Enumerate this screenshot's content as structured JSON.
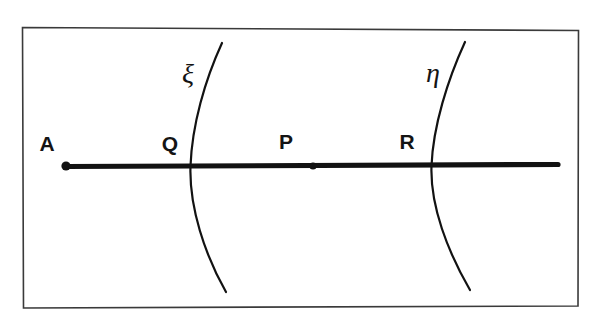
{
  "figure": {
    "title": "",
    "background_color": "#ffffff",
    "ink_color": "#121212",
    "frame": {
      "name": "figure-border",
      "color": "#3a3a3a",
      "x": 22,
      "y": 27,
      "width": 556,
      "height": 280
    },
    "line": {
      "name": "horizontal-axis-line",
      "x_start": 66,
      "x_end": 558,
      "y": 166,
      "thickness": 5,
      "color": "#121212"
    },
    "points": [
      {
        "id": "A",
        "label": "A",
        "label_x": 47,
        "label_y": 151,
        "dot_x": 66,
        "dot_y": 166,
        "has_dot": true,
        "dot_radius": 4.6
      },
      {
        "id": "Q",
        "label": "Q",
        "label_x": 170,
        "label_y": 151,
        "dot_x": 191,
        "dot_y": 166,
        "has_dot": false,
        "dot_radius": 0
      },
      {
        "id": "P",
        "label": "P",
        "label_x": 286,
        "label_y": 149,
        "dot_x": 313,
        "dot_y": 166,
        "has_dot": true,
        "dot_radius": 3.6
      },
      {
        "id": "R",
        "label": "R",
        "label_x": 407,
        "label_y": 149,
        "dot_x": 433,
        "dot_y": 166,
        "has_dot": false,
        "dot_radius": 0
      }
    ],
    "curves": [
      {
        "id": "xi",
        "label": "ξ",
        "label_x": 188,
        "label_y": 83,
        "path": "M 222,43 C 205,80 192,125 190.5,166 C 189,207 205,255 226,292",
        "crosses_at_x": 191,
        "crosses_at_y": 166
      },
      {
        "id": "eta",
        "label": "η",
        "label_x": 433,
        "label_y": 82,
        "path": "M 465,42 C 448,79 433,126 431.5,166 C 430,206 448,252 470,290",
        "crosses_at_x": 433,
        "crosses_at_y": 166
      }
    ]
  }
}
